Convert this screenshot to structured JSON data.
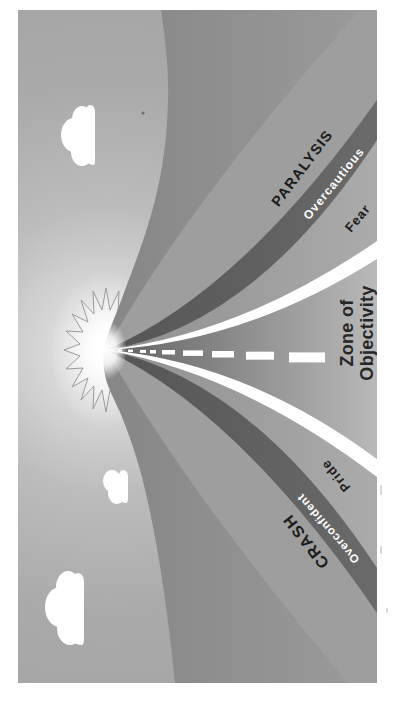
{
  "figure": {
    "labels": {
      "paralysis": "PARALYSIS",
      "overcautious": "Overcautious",
      "fear": "Fear",
      "zone_line1": "Zone of",
      "zone_line2": "Objectivity",
      "pride": "Pride",
      "overconfident": "Overconfident",
      "crash": "CRASH"
    },
    "colors": {
      "page_bg": "#ffffff",
      "sky_far": "#a2a2a2",
      "sky_horizon": "#ececec",
      "hill_top": "#868686",
      "hill_bottom": "#9b9b9b",
      "outer_zone": "#9e9e9e",
      "caution_band_dark": "#565656",
      "lane_gray": "#a6a6a6",
      "road_dark": "#606060",
      "road_light": "#b9b9b9",
      "stripe_white": "#ffffff",
      "label_dark": "#1c1c1c",
      "label_light": "#ffffff",
      "zone_text": "#262626",
      "sun_core": "#ffffff",
      "sun_ray_outline": "#9b9b9b"
    }
  }
}
